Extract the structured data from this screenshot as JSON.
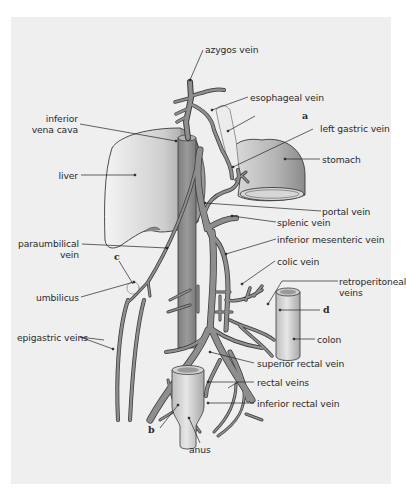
{
  "figure": {
    "type": "anatomical diagram",
    "colors": {
      "background": "#ffffff",
      "panel": "#efefef",
      "vein_fill": "#8e8e8e",
      "vein_outline": "#3a3a3a",
      "organ_light": "#e4e4e4",
      "organ_dark": "#8a8a8a",
      "leader_line": "#222222",
      "text": "#2a2a2a"
    },
    "labels": {
      "azygos_vein": "azygos vein",
      "esophageal_vein": "esophageal vein",
      "a": "a",
      "left_gastric_vein": "left gastric vein",
      "stomach": "stomach",
      "inferior_vena_cava": "inferior\nvena cava",
      "inferior_vena_cava_line1": "inferior",
      "inferior_vena_cava_line2": "vena cava",
      "liver": "liver",
      "portal_vein": "portal vein",
      "splenic_vein": "splenic vein",
      "inferior_mesenteric_vein": "inferior mesenteric vein",
      "paraumbilical_vein_line1": "paraumbilical",
      "paraumbilical_vein_line2": "vein",
      "c": "c",
      "colic_vein": "colic vein",
      "umbilicus": "umbilicus",
      "retroperitoneal_veins_line1": "retroperitoneal",
      "retroperitoneal_veins_line2": "veins",
      "d": "d",
      "epigastric_veins": "epigastric veins",
      "colon": "colon",
      "superior_rectal_vein": "superior rectal vein",
      "rectal_veins": "rectal veins",
      "inferior_rectal_vein": "inferior rectal vein",
      "b": "b",
      "anus": "anus"
    }
  }
}
